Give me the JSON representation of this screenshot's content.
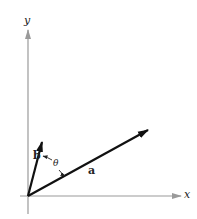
{
  "diagram": {
    "type": "vector-angle",
    "axes": {
      "x_label": "x",
      "y_label": "y",
      "axis_color": "#9a9a9a"
    },
    "vectors": [
      {
        "name": "a",
        "label": "a",
        "from": [
          28,
          196
        ],
        "to": [
          148,
          130
        ],
        "color": "#111111"
      },
      {
        "name": "b",
        "label": "b",
        "from": [
          28,
          196
        ],
        "to": [
          42,
          143
        ],
        "color": "#111111"
      }
    ],
    "angle": {
      "label": "θ",
      "between": [
        "a",
        "b"
      ]
    }
  }
}
